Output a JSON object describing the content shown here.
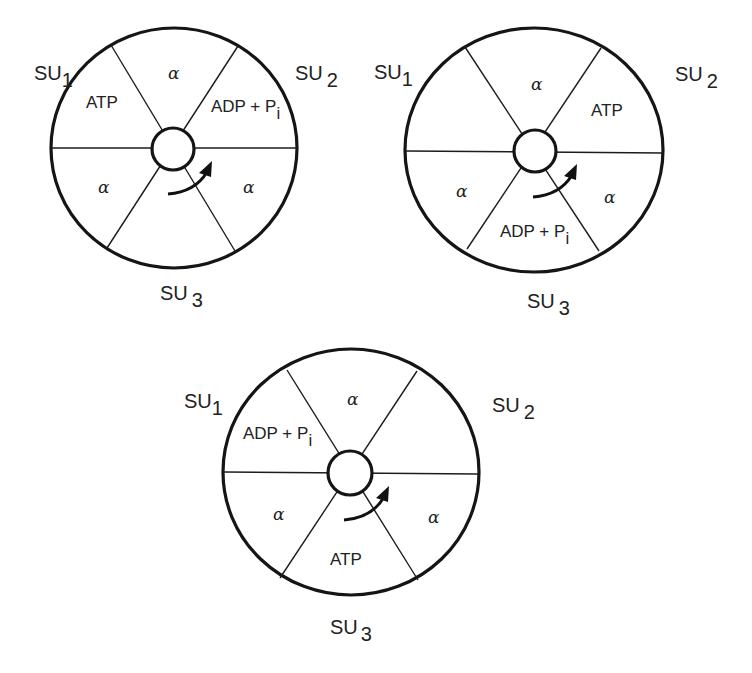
{
  "figure": {
    "rotation_arrow": "counterclockwise-to-clockwise curved arrow indicating rotation",
    "subunit_prefix": "SU",
    "alpha_symbol": "α",
    "diagrams": [
      {
        "id": "state-1",
        "su1": {
          "main": "SU",
          "sub": "1"
        },
        "su2": {
          "main": "SU",
          "sub": "2"
        },
        "su3": {
          "main": "SU",
          "sub": "3"
        },
        "sectors": {
          "top": "α",
          "upper_left": "ATP",
          "upper_right": {
            "main": "ADP + P",
            "sub": "i"
          },
          "lower_left": "α",
          "lower_right": "α",
          "bottom": ""
        }
      },
      {
        "id": "state-2",
        "su1": {
          "main": "SU",
          "sub": "1"
        },
        "su2": {
          "main": "SU",
          "sub": "2"
        },
        "su3": {
          "main": "SU",
          "sub": "3"
        },
        "sectors": {
          "top": "α",
          "upper_left": "",
          "upper_right": "ATP",
          "lower_left": "α",
          "lower_right": "α",
          "bottom": {
            "main": "ADP + P",
            "sub": "i"
          }
        }
      },
      {
        "id": "state-3",
        "su1": {
          "main": "SU",
          "sub": "1"
        },
        "su2": {
          "main": "SU",
          "sub": "2"
        },
        "su3": {
          "main": "SU",
          "sub": "3"
        },
        "sectors": {
          "top": "α",
          "upper_left": {
            "main": "ADP + P",
            "sub": "i"
          },
          "upper_right": "",
          "lower_left": "α",
          "lower_right": "α",
          "bottom": "ATP"
        }
      }
    ]
  }
}
